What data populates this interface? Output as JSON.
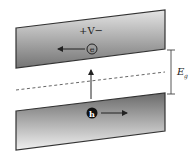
{
  "diagram": {
    "upper_band": {
      "label": "+V−",
      "carrier": "e",
      "carrier_direction": "left"
    },
    "lower_band": {
      "carrier": "h",
      "carrier_direction": "right"
    },
    "gap_label": "E",
    "gap_label_sub": "g",
    "fermi_line": "dashed",
    "colors": {
      "band_dark": "#6e6e6e",
      "band_light": "#e6e6e6",
      "outline": "#333333",
      "arrow": "#222222"
    }
  }
}
